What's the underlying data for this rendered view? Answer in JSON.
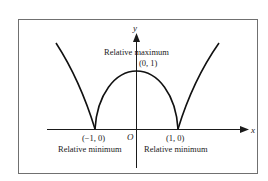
{
  "diagram": {
    "axes": {
      "x_label": "x",
      "y_label": "y",
      "origin_label": "O"
    },
    "points": [
      {
        "coord": "(0, 1)",
        "annotation": "Relative maximum"
      },
      {
        "coord": "(−1, 0)",
        "annotation": "Relative minimum"
      },
      {
        "coord": "(1, 0)",
        "annotation": "Relative minimum"
      }
    ],
    "colors": {
      "curve": "#111111",
      "frame": "#707070",
      "background": "#ffffff"
    }
  }
}
